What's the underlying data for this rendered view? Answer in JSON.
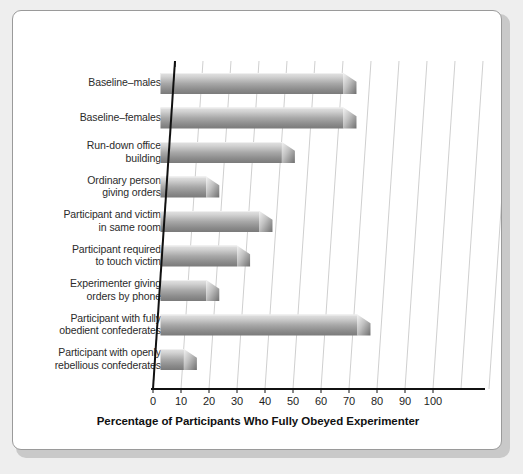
{
  "figure": {
    "panel_background": "#ffffff",
    "page_background": "#eeeeee",
    "border_color": "#9a9a9a"
  },
  "chart_data": {
    "type": "bar",
    "orientation": "horizontal",
    "title": "",
    "subtitle": "",
    "xlabel": "Percentage of Participants Who Fully Obeyed Experimenter",
    "ylabel": "",
    "xlim": [
      0,
      110
    ],
    "xticks": [
      0,
      10,
      20,
      30,
      40,
      50,
      60,
      70,
      80,
      90,
      100
    ],
    "xtick_labels": [
      "0",
      "10",
      "20",
      "30",
      "40",
      "50",
      "60",
      "70",
      "80",
      "90",
      "100"
    ],
    "grid": "vertical-slanted",
    "legend": "none",
    "bar_style": {
      "fill_top": "#dcdcdc",
      "fill_bottom": "#808080",
      "tip": "3d-cone",
      "effect": "pseudo-3d"
    },
    "categories": [
      "Baseline–males",
      "Baseline–females",
      "Run-down office building",
      "Ordinary person giving orders",
      "Participant and victim in same room",
      "Participant required to touch victim",
      "Experimenter giving orders by phone",
      "Participant with fully obedient confederates",
      "Participant with openly rebellious confederates"
    ],
    "category_labels_wrapped": [
      "Baseline–males",
      "Baseline–females",
      "Run-down office\nbuilding",
      "Ordinary person\ngiving orders",
      "Participant and victim\nin same room",
      "Participant required\nto touch victim",
      "Experimenter giving\norders by phone",
      "Participant with fully\nobedient confederates",
      "Participant with openly\nrebellious confederates"
    ],
    "values": [
      70,
      70,
      48,
      21,
      40,
      32,
      21,
      75,
      13
    ]
  }
}
